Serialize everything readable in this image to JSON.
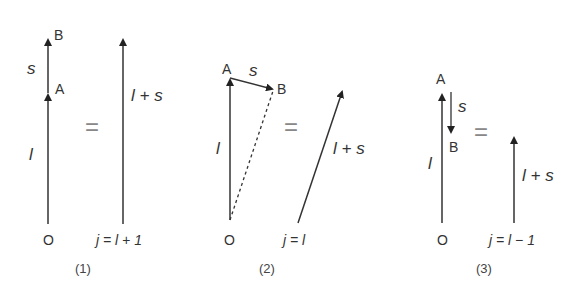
{
  "panels": [
    {
      "caption": "(1)",
      "origin": "O",
      "point_a": "A",
      "point_b": "B",
      "vec_l": "l",
      "vec_s": "s",
      "equals": "=",
      "result_label": "l + s",
      "j_label": "j = l + 1"
    },
    {
      "caption": "(2)",
      "origin": "O",
      "point_a": "A",
      "point_b": "B",
      "vec_l": "l",
      "vec_s": "s",
      "equals": "=",
      "result_label": "l + s",
      "j_label": "j = l"
    },
    {
      "caption": "(3)",
      "origin": "O",
      "point_a": "A",
      "point_b": "B",
      "vec_l": "l",
      "vec_s": "s",
      "equals": "=",
      "result_label": "l + s",
      "j_label": "j = l − 1"
    }
  ]
}
